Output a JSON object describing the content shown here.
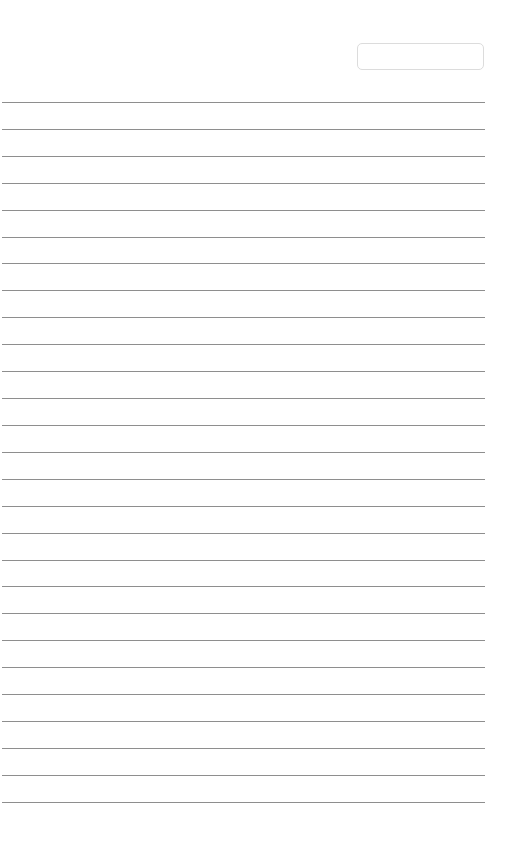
{
  "page": {
    "width": 506,
    "height": 850,
    "background_color": "#ffffff",
    "kind": "blank-ruled-page"
  },
  "header": {
    "field": {
      "value": "",
      "placeholder": "",
      "border_color": "#dcdcdc",
      "background_color": "#ffffff",
      "x": 357,
      "y": 43,
      "width": 127,
      "height": 27
    }
  },
  "ruled_area": {
    "line_color": "#8e8e8e",
    "line_left": 2,
    "line_width": 483,
    "first_line_y": 102,
    "line_spacing": 26.9,
    "line_count": 27,
    "lines": [
      {
        "y": 102,
        "text": ""
      },
      {
        "y": 129,
        "text": ""
      },
      {
        "y": 156,
        "text": ""
      },
      {
        "y": 183,
        "text": ""
      },
      {
        "y": 210,
        "text": ""
      },
      {
        "y": 237,
        "text": ""
      },
      {
        "y": 263,
        "text": ""
      },
      {
        "y": 290,
        "text": ""
      },
      {
        "y": 317,
        "text": ""
      },
      {
        "y": 344,
        "text": ""
      },
      {
        "y": 371,
        "text": ""
      },
      {
        "y": 398,
        "text": ""
      },
      {
        "y": 425,
        "text": ""
      },
      {
        "y": 452,
        "text": ""
      },
      {
        "y": 479,
        "text": ""
      },
      {
        "y": 506,
        "text": ""
      },
      {
        "y": 533,
        "text": ""
      },
      {
        "y": 560,
        "text": ""
      },
      {
        "y": 586,
        "text": ""
      },
      {
        "y": 613,
        "text": ""
      },
      {
        "y": 640,
        "text": ""
      },
      {
        "y": 667,
        "text": ""
      },
      {
        "y": 694,
        "text": ""
      },
      {
        "y": 721,
        "text": ""
      },
      {
        "y": 748,
        "text": ""
      },
      {
        "y": 775,
        "text": ""
      },
      {
        "y": 802,
        "text": ""
      }
    ]
  }
}
